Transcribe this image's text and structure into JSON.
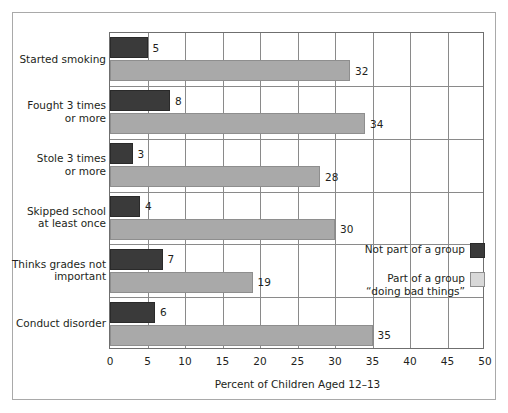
{
  "chart_data": {
    "type": "bar",
    "orientation": "horizontal",
    "title": "",
    "xlabel": "Percent of Children Aged 12–13",
    "ylabel": "",
    "xlim": [
      0,
      50
    ],
    "xticks": [
      0,
      5,
      10,
      15,
      20,
      25,
      30,
      35,
      40,
      45,
      50
    ],
    "xtick_labels": [
      "0",
      "5",
      "10",
      "15",
      "20",
      "25",
      "30",
      "35",
      "40",
      "45",
      "50"
    ],
    "grid": "vertical",
    "legend_position": "inside-right",
    "categories": [
      "Started smoking",
      "Fought 3 times\nor more",
      "Stole 3 times\nor more",
      "Skipped school\nat least once",
      "Thinks grades not\nimportant",
      "Conduct disorder"
    ],
    "series": [
      {
        "name": "Not part of a group",
        "color": "#3a3a3a",
        "values": [
          5,
          8,
          3,
          4,
          7,
          6
        ],
        "value_labels": [
          "5",
          "8",
          "3",
          "4",
          "7",
          "6"
        ]
      },
      {
        "name": "Part of a group\n“doing bad things”",
        "color": "#a9a9a9",
        "values": [
          32,
          34,
          28,
          30,
          19,
          35
        ],
        "value_labels": [
          "32",
          "34",
          "28",
          "30",
          "19",
          "35"
        ]
      }
    ]
  },
  "legend": {
    "items": [
      {
        "label": "Not part of a group",
        "swatch": "dark"
      },
      {
        "label": "Part of a group\n“doing bad things”",
        "swatch": "light"
      }
    ]
  }
}
